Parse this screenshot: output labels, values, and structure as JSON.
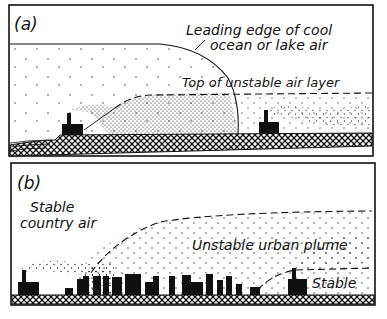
{
  "figure": {
    "panels": [
      {
        "id": "a",
        "label": "(a)",
        "annotations": {
          "leading_edge_line1": "Leading edge of cool",
          "leading_edge_line2": "ocean or lake air",
          "top_unstable": "Top of unstable air layer"
        }
      },
      {
        "id": "b",
        "label": "(b)",
        "annotations": {
          "stable_country_line1": "Stable",
          "stable_country_line2": "country air",
          "urban_plume": "Unstable urban plume",
          "stable": "Stable"
        }
      }
    ]
  },
  "colors": {
    "ink": "#111111",
    "background": "#ffffff"
  }
}
